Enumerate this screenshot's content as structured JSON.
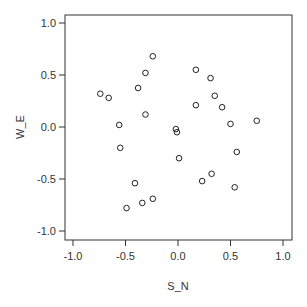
{
  "chart_data": {
    "type": "scatter",
    "title": "",
    "xlabel": "S_N",
    "ylabel": "W_E",
    "xlim": [
      -1.0,
      1.0
    ],
    "ylim": [
      -1.0,
      1.0
    ],
    "xticks": [
      "-1.0",
      "-0.5",
      "0.0",
      "0.5",
      "1.0"
    ],
    "yticks": [
      "-1.0",
      "-0.5",
      "0.0",
      "0.5",
      "1.0"
    ],
    "xtick_values": [
      -1.0,
      -0.5,
      0.0,
      0.5,
      1.0
    ],
    "ytick_values": [
      -1.0,
      -0.5,
      0.0,
      0.5,
      1.0
    ],
    "grid": false,
    "marker": "open-circle",
    "colors": {
      "points": "#222222",
      "axes": "#333333"
    },
    "points": [
      {
        "x": -0.24,
        "y": 0.68
      },
      {
        "x": -0.31,
        "y": 0.52
      },
      {
        "x": -0.38,
        "y": 0.375
      },
      {
        "x": -0.74,
        "y": 0.32
      },
      {
        "x": -0.66,
        "y": 0.28
      },
      {
        "x": -0.31,
        "y": 0.12
      },
      {
        "x": -0.56,
        "y": 0.02
      },
      {
        "x": -0.55,
        "y": -0.2
      },
      {
        "x": 0.17,
        "y": 0.55
      },
      {
        "x": 0.31,
        "y": 0.47
      },
      {
        "x": 0.35,
        "y": 0.3
      },
      {
        "x": 0.17,
        "y": 0.21
      },
      {
        "x": 0.42,
        "y": 0.19
      },
      {
        "x": 0.5,
        "y": 0.03
      },
      {
        "x": 0.75,
        "y": 0.06
      },
      {
        "x": -0.02,
        "y": -0.02
      },
      {
        "x": -0.01,
        "y": -0.05
      },
      {
        "x": 0.01,
        "y": -0.3
      },
      {
        "x": 0.56,
        "y": -0.24
      },
      {
        "x": 0.32,
        "y": -0.45
      },
      {
        "x": 0.23,
        "y": -0.52
      },
      {
        "x": 0.54,
        "y": -0.58
      },
      {
        "x": -0.41,
        "y": -0.54
      },
      {
        "x": -0.24,
        "y": -0.69
      },
      {
        "x": -0.34,
        "y": -0.73
      },
      {
        "x": -0.49,
        "y": -0.78
      }
    ]
  }
}
